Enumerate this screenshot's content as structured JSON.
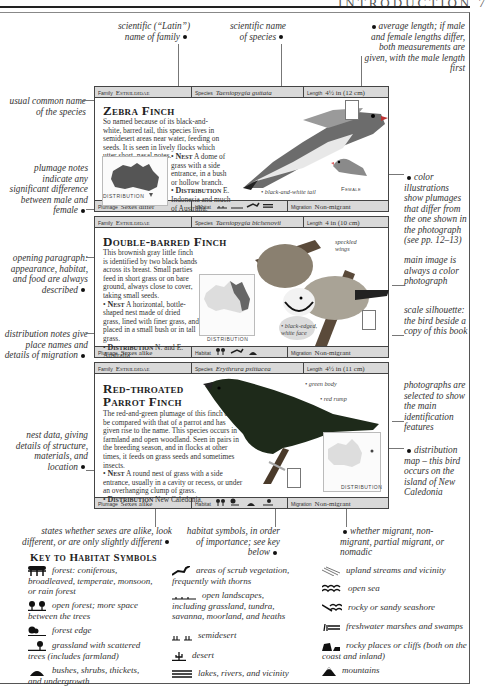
{
  "running_head": "INTRODUCTION  7",
  "callouts": {
    "family": "scientific (“Latin”) name of family",
    "species": "scientific name of species",
    "length": "average length; if male and female lengths differ, both measurements are given, with the male length first",
    "common_name": "usual common name of the species",
    "plumage": "plumage notes indicate any significant difference between male and female",
    "color_illus": "color illustrations show plumages that differ from the one shown in the photograph (see pp. 12–13)",
    "main_image": "main image is always a color photograph",
    "opening": "opening paragraph: appearance, habitat, and food are always described",
    "scale": "scale silhouette: the bird beside a copy of this book",
    "distribution": "distribution notes give place names and details of migration",
    "photos": "photographs are selected to show the main identification features",
    "dist_map": "distribution map – this bird occurs on the island of New Caledonia",
    "nest": "nest data, giving details of structure, materials, and location",
    "sexes": "states whether sexes are alike, look different, or are only slightly different",
    "habitat": "habitat symbols, in order of importance; see key below",
    "migrant": "whether migrant, non-migrant, partial migrant, or nomadic"
  },
  "cards": [
    {
      "family_label": "Family",
      "family": "Estrildidae",
      "species_label": "Species",
      "species": "Taeniopygia guttata",
      "length_label": "Length",
      "length": "4½ in (12 cm)",
      "title": "Zebra Finch",
      "text": "So named because of its black-and-white, barred tail, this species lives in semidesert areas near water, feeding on seeds. It is seen in lively flocks which utter short, nasal notes.",
      "nest_label": "Nest",
      "nest": "A dome of grass with a side entrance, in a bush or hollow branch.",
      "dist_label": "Distribution",
      "dist": "E. Indonesia and much of Australia.",
      "map_label": "DISTRIBUTION",
      "annotations": [
        "black-and-white tail",
        "Female"
      ],
      "plumage_label": "Plumage",
      "plumage": "Sexes differ",
      "habitat_label": "Habitat",
      "migration_label": "Migration",
      "migration": "Non-migrant"
    },
    {
      "family_label": "Family",
      "family": "Estrildidae",
      "species_label": "Species",
      "species": "Taeniopygia bichenovii",
      "length_label": "Length",
      "length": "4 in (10 cm)",
      "title": "Double-barred Finch",
      "text": "This brownish gray little finch is identified by two black bands across its breast. Small parties feed in short grass or on bare ground, always close to cover, taking small seeds.",
      "nest_label": "Nest",
      "nest": "A horizontal, bottle-shaped nest made of dried grass, lined with finer grass, and placed in a small bush or in tall grass.",
      "dist_label": "Distribution",
      "dist": "N. and E. Australia.",
      "map_label": "DISTRIBUTION",
      "annotations": [
        "speckled wings",
        "black-edged, white face"
      ],
      "plumage_label": "Plumage",
      "plumage": "Sexes alike",
      "habitat_label": "Habitat",
      "migration_label": "Migration",
      "migration": "Non-migrant"
    },
    {
      "family_label": "Family",
      "family": "Estrildidae",
      "species_label": "Species",
      "species": "Erythrura psittacea",
      "length_label": "Length",
      "length": "4½ in (11 cm)",
      "title_line1": "Red-throated",
      "title_line2": "Parrot Finch",
      "text": "The red-and-green plumage of this finch can be compared with that of a parrot and has given rise to the name. This species occurs in farmland and open woodland. Seen in pairs in the breeding season, and in flocks at other times, it feeds on grass seeds and sometimes insects.",
      "nest_label": "Nest",
      "nest": "A round nest of grass with a side entrance, usually in a cavity or recess, or under an overhanging clump of grass.",
      "dist_label": "Distribution",
      "dist": "New Caledonia.",
      "map_label": "DISTRIBUTION",
      "annotations": [
        "green body",
        "red rump"
      ],
      "plumage_label": "Plumage",
      "plumage": "Sexes alike",
      "habitat_label": "Habitat",
      "migration_label": "Migration",
      "migration": "Non-migrant"
    }
  ],
  "key": {
    "title": "Key to Habitat Symbols",
    "items": [
      {
        "icon": "coniferous-forest-icon",
        "text": "forest: coniferous, broadleaved, temperate, monsoon, or rain forest"
      },
      {
        "icon": "open-forest-icon",
        "text": "open forest; more space between the trees"
      },
      {
        "icon": "forest-edge-icon",
        "text": "forest edge"
      },
      {
        "icon": "grassland-trees-icon",
        "text": "grassland with scattered trees (includes farmland)"
      },
      {
        "icon": "bushes-icon",
        "text": "bushes, shrubs, thickets, and undergrowth"
      },
      {
        "icon": "scrub-icon",
        "text": "areas of scrub vegetation, frequently with thorns"
      },
      {
        "icon": "open-landscape-icon",
        "text": "open landscapes, including grassland, tundra, savanna, moorland, and heaths"
      },
      {
        "icon": "semidesert-icon",
        "text": "semidesert"
      },
      {
        "icon": "desert-icon",
        "text": "desert"
      },
      {
        "icon": "lakes-rivers-icon",
        "text": "lakes, rivers, and vicinity"
      },
      {
        "icon": "upland-streams-icon",
        "text": "upland streams and vicinity"
      },
      {
        "icon": "open-sea-icon",
        "text": "open sea"
      },
      {
        "icon": "seashore-icon",
        "text": "rocky or sandy seashore"
      },
      {
        "icon": "marsh-icon",
        "text": "freshwater marshes and swamps"
      },
      {
        "icon": "rocky-cliffs-icon",
        "text": "rocky places or cliffs (both on the coast and inland)"
      },
      {
        "icon": "mountains-icon",
        "text": "mountains"
      }
    ]
  },
  "colors": {
    "bar_bg": "#d9d9d9",
    "rule": "#222222",
    "map_land": "#555555",
    "map_land_light": "#cfcfcf"
  }
}
